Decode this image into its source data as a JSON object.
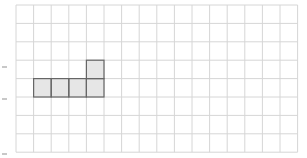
{
  "diagram": {
    "type": "grid-shape",
    "grid": {
      "columns": 16,
      "rows": 8,
      "origin_x": 16,
      "origin_y": 5,
      "cell_width": 17.6,
      "cell_height": 18.4,
      "line_color": "#d6d6d6",
      "background": "#ffffff"
    },
    "shape": {
      "fill": "#e6e6e6",
      "stroke": "#666666",
      "cells": [
        {
          "col": 1,
          "row": 4
        },
        {
          "col": 2,
          "row": 4
        },
        {
          "col": 3,
          "row": 4
        },
        {
          "col": 4,
          "row": 4
        },
        {
          "col": 4,
          "row": 3
        }
      ]
    },
    "side_markers": [
      {
        "x": 2,
        "y": 66
      },
      {
        "x": 2,
        "y": 98
      },
      {
        "x": 2,
        "y": 153
      }
    ]
  }
}
